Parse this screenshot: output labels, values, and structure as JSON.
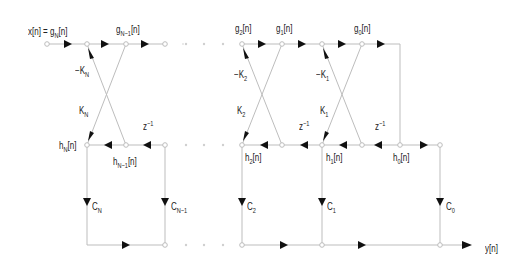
{
  "diagram": {
    "type": "lattice-ladder filter",
    "labels": {
      "input": "x[n] = g",
      "input_sub": "N",
      "input_suffix": "[n]",
      "gN1": "g",
      "gN1_sub": "N−1",
      "g2": "g",
      "g2_sub": "2",
      "g1": "g",
      "g1_sub": "1",
      "g0": "g",
      "g0_sub": "0",
      "n_suffix": "[n]",
      "hN": "h",
      "hN_sub": "N",
      "hN1": "h",
      "hN1_sub": "N−1",
      "h2": "h",
      "h2_sub": "2",
      "h1": "h",
      "h1_sub": "1",
      "h0": "h",
      "h0_sub": "0",
      "negKN": "−K",
      "negKN_sub": "N",
      "KN": "K",
      "KN_sub": "N",
      "negK2": "−K",
      "negK2_sub": "2",
      "K2": "K",
      "K2_sub": "2",
      "negK1": "−K",
      "negK1_sub": "1",
      "K1": "K",
      "K1_sub": "1",
      "z": "z",
      "z_sup": "−1",
      "CN": "C",
      "CN_sub": "N",
      "CN1": "C",
      "CN1_sub": "N−1",
      "C2": "C",
      "C2_sub": "2",
      "C1": "C",
      "C1_sub": "1",
      "C0": "C",
      "C0_sub": "0",
      "output": "y[n]"
    },
    "colors": {
      "wire": "#bdbdbd",
      "arrow": "#111111",
      "text": "#222222"
    }
  }
}
